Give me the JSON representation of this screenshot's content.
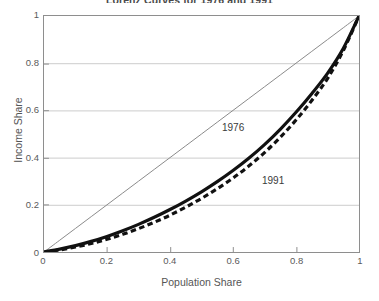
{
  "chart_data": {
    "type": "line",
    "title": "Lorenz Curves for 1976 and 1991",
    "xlabel": "Population Share",
    "ylabel": "Income Share",
    "xlim": [
      0,
      1
    ],
    "ylim": [
      0,
      1
    ],
    "xticks": [
      "0",
      "0.2",
      "0.4",
      "0.6",
      "0.8",
      "1"
    ],
    "xtick_values": [
      0,
      0.2,
      0.4,
      0.6,
      0.8,
      1
    ],
    "yticks": [
      "0",
      "0.2",
      "0.4",
      "0.6",
      "0.8",
      "1"
    ],
    "ytick_values": [
      0,
      0.2,
      0.4,
      0.6,
      0.8,
      1
    ],
    "grid": "horizontal",
    "legend_position": "inline-annotations",
    "x": [
      0,
      0.05,
      0.1,
      0.15,
      0.2,
      0.25,
      0.3,
      0.35,
      0.4,
      0.45,
      0.5,
      0.55,
      0.6,
      0.65,
      0.7,
      0.75,
      0.8,
      0.85,
      0.9,
      0.95,
      1
    ],
    "series": [
      {
        "name": "equality-line",
        "label": "",
        "style": "thin-solid",
        "color": "#8a8a8a",
        "values": [
          0,
          0.05,
          0.1,
          0.15,
          0.2,
          0.25,
          0.3,
          0.35,
          0.4,
          0.45,
          0.5,
          0.55,
          0.6,
          0.65,
          0.7,
          0.75,
          0.8,
          0.85,
          0.9,
          0.95,
          1
        ]
      },
      {
        "name": "1976",
        "label": "1976",
        "style": "solid",
        "color": "#111111",
        "values": [
          0,
          0.012,
          0.027,
          0.045,
          0.066,
          0.09,
          0.117,
          0.147,
          0.18,
          0.216,
          0.255,
          0.298,
          0.345,
          0.397,
          0.455,
          0.52,
          0.592,
          0.671,
          0.757,
          0.862,
          1
        ]
      },
      {
        "name": "1991",
        "label": "1991",
        "style": "dashed",
        "color": "#111111",
        "values": [
          0,
          0.009,
          0.021,
          0.036,
          0.054,
          0.075,
          0.099,
          0.126,
          0.156,
          0.19,
          0.227,
          0.268,
          0.313,
          0.364,
          0.421,
          0.486,
          0.559,
          0.642,
          0.735,
          0.853,
          1
        ]
      }
    ],
    "annotations": [
      {
        "text": "1976",
        "x": 0.6,
        "y": 0.42
      },
      {
        "text": "1991",
        "x": 0.69,
        "y": 0.25
      }
    ]
  },
  "axes": {
    "x_title": "Population Share",
    "y_title": "Income Share"
  },
  "colors": {
    "frame": "#8e8e8e",
    "gridline": "#cccccc",
    "equality_line": "#8a8a8a",
    "curve": "#111111",
    "text": "#555555",
    "background": "#ffffff"
  }
}
